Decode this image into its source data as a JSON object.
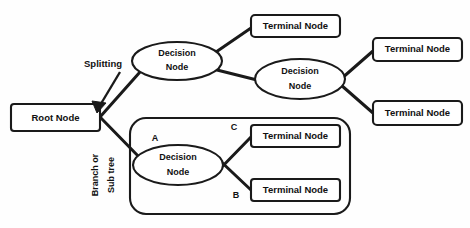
{
  "diagram": {
    "background_color": "#fefefe",
    "stroke_color": "#1a1a1a",
    "text_color": "#111111",
    "nodes": [
      {
        "id": "root",
        "label": "Root Node",
        "shape": "rect",
        "x": 10,
        "y": 103,
        "w": 90,
        "h": 28
      },
      {
        "id": "decision1",
        "label_line1": "Decision",
        "label_line2": "Node",
        "shape": "ellipse",
        "cx": 177,
        "cy": 61,
        "rx": 45,
        "ry": 19
      },
      {
        "id": "terminal1",
        "label": "Terminal Node",
        "shape": "rect",
        "x": 250,
        "y": 14,
        "w": 90,
        "h": 23
      },
      {
        "id": "decision2",
        "label_line1": "Decision",
        "label_line2": "Node",
        "shape": "ellipse",
        "cx": 300,
        "cy": 79,
        "rx": 45,
        "ry": 20
      },
      {
        "id": "terminal2",
        "label": "Terminal Node",
        "shape": "rect",
        "x": 372,
        "y": 37,
        "w": 90,
        "h": 24
      },
      {
        "id": "terminal3",
        "label": "Terminal Node",
        "shape": "rect",
        "x": 372,
        "y": 100,
        "w": 90,
        "h": 25
      },
      {
        "id": "decision3",
        "label_line1": "Decision",
        "label_line2": "Node",
        "shape": "ellipse",
        "cx": 178,
        "cy": 165,
        "rx": 45,
        "ry": 20
      },
      {
        "id": "terminal4",
        "label": "Terminal Node",
        "shape": "rect",
        "x": 250,
        "y": 124,
        "w": 90,
        "h": 23
      },
      {
        "id": "terminal5",
        "label": "Terminal Node",
        "shape": "rect",
        "x": 250,
        "y": 178,
        "w": 90,
        "h": 23
      }
    ],
    "subtree_group": {
      "label": "subtree-boundary",
      "x": 129,
      "y": 117,
      "w": 221,
      "h": 97,
      "radius": 16
    },
    "edges": [
      {
        "id": "root-to-decision1",
        "from": "root",
        "to": "decision1"
      },
      {
        "id": "root-to-subtree",
        "from": "root",
        "to": "decision3"
      },
      {
        "id": "d1-to-terminal1",
        "from": "decision1",
        "to": "terminal1"
      },
      {
        "id": "d1-to-decision2",
        "from": "decision1",
        "to": "decision2"
      },
      {
        "id": "d2-to-terminal2",
        "from": "decision2",
        "to": "terminal2"
      },
      {
        "id": "d2-to-terminal3",
        "from": "decision2",
        "to": "terminal3"
      },
      {
        "id": "d3-to-terminal4",
        "from": "decision3",
        "to": "terminal4"
      },
      {
        "id": "d3-to-terminal5",
        "from": "decision3",
        "to": "terminal5"
      }
    ],
    "annotations": [
      {
        "id": "splitting",
        "text": "Splitting",
        "x": 103,
        "y": 64,
        "rotation": 0
      },
      {
        "id": "branch-l1",
        "text": "Branch or",
        "x": 96,
        "y": 175,
        "rotation": -90
      },
      {
        "id": "branch-l2",
        "text": "Sub tree",
        "x": 112,
        "y": 175,
        "rotation": -90
      }
    ],
    "branch_labels": [
      {
        "id": "label-a",
        "text": "A",
        "x": 155,
        "y": 139
      },
      {
        "id": "label-b",
        "text": "B",
        "x": 236,
        "y": 196
      },
      {
        "id": "label-c",
        "text": "C",
        "x": 234,
        "y": 128
      }
    ]
  }
}
